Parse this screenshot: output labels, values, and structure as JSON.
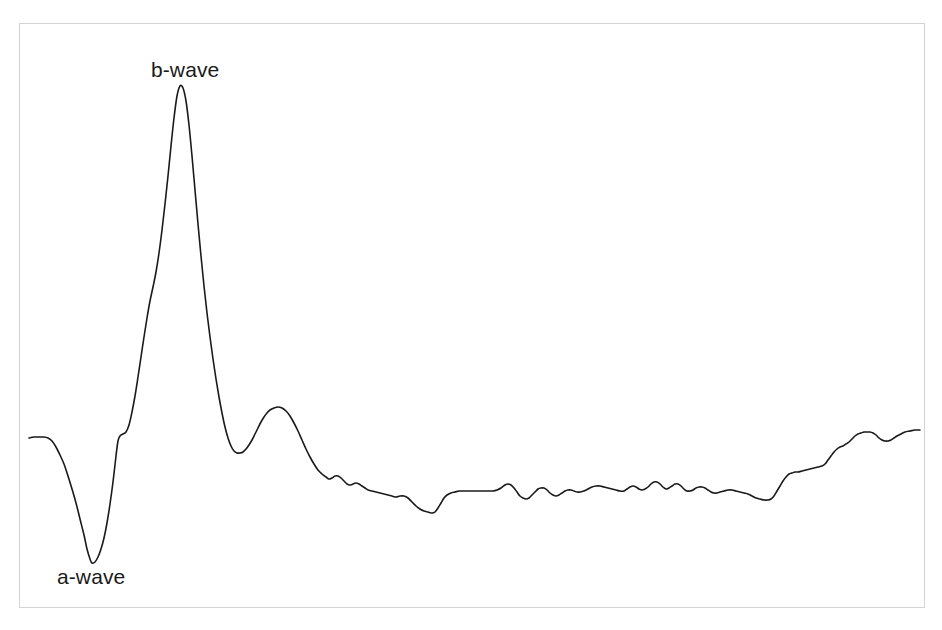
{
  "figure": {
    "kind": "electroretinogram-trace",
    "background_color": "#ffffff",
    "frame": {
      "border_color": "#d3d3d3",
      "fill_color": "#ffffff",
      "x": 19,
      "y": 23,
      "width": 906,
      "height": 585
    }
  },
  "annotations": {
    "b_wave_label": "b-wave",
    "a_wave_label": "a-wave"
  },
  "chart_data": {
    "type": "line",
    "title": "",
    "subtitle": "",
    "xlabel": "",
    "ylabel": "",
    "grid": false,
    "legend": null,
    "axes_visible": false,
    "tick_labels_x": [],
    "tick_labels_y": [],
    "xlim": [
      29,
      920
    ],
    "ylim": [
      608,
      23
    ],
    "series": [
      {
        "name": "ERG response",
        "color": "#1a1a1a",
        "line_width": 1.6,
        "points": [
          [
            29,
            438
          ],
          [
            34,
            437
          ],
          [
            39,
            437
          ],
          [
            44,
            437
          ],
          [
            48,
            438
          ],
          [
            52,
            441
          ],
          [
            56,
            447
          ],
          [
            60,
            455
          ],
          [
            64,
            464
          ],
          [
            68,
            476
          ],
          [
            72,
            489
          ],
          [
            76,
            503
          ],
          [
            80,
            519
          ],
          [
            84,
            535
          ],
          [
            87,
            549
          ],
          [
            90,
            559
          ],
          [
            92,
            563
          ],
          [
            95,
            562
          ],
          [
            98,
            557
          ],
          [
            101,
            549
          ],
          [
            104,
            538
          ],
          [
            107,
            523
          ],
          [
            110,
            504
          ],
          [
            113,
            482
          ],
          [
            116,
            456
          ],
          [
            118,
            441
          ],
          [
            120,
            436
          ],
          [
            123,
            434
          ],
          [
            126,
            432
          ],
          [
            129,
            425
          ],
          [
            132,
            412
          ],
          [
            135,
            396
          ],
          [
            138,
            377
          ],
          [
            141,
            357
          ],
          [
            144,
            337
          ],
          [
            147,
            318
          ],
          [
            150,
            301
          ],
          [
            153,
            287
          ],
          [
            156,
            272
          ],
          [
            159,
            253
          ],
          [
            162,
            230
          ],
          [
            165,
            204
          ],
          [
            168,
            176
          ],
          [
            171,
            146
          ],
          [
            174,
            118
          ],
          [
            177,
            96
          ],
          [
            180,
            86
          ],
          [
            183,
            88
          ],
          [
            186,
            101
          ],
          [
            189,
            125
          ],
          [
            192,
            156
          ],
          [
            195,
            190
          ],
          [
            198,
            224
          ],
          [
            201,
            256
          ],
          [
            204,
            286
          ],
          [
            207,
            313
          ],
          [
            210,
            337
          ],
          [
            213,
            359
          ],
          [
            216,
            379
          ],
          [
            219,
            397
          ],
          [
            222,
            413
          ],
          [
            225,
            427
          ],
          [
            228,
            438
          ],
          [
            231,
            446
          ],
          [
            234,
            451
          ],
          [
            237,
            453
          ],
          [
            240,
            453
          ],
          [
            243,
            452
          ],
          [
            246,
            449
          ],
          [
            249,
            445
          ],
          [
            252,
            440
          ],
          [
            255,
            434
          ],
          [
            258,
            428
          ],
          [
            261,
            422
          ],
          [
            264,
            417
          ],
          [
            267,
            413
          ],
          [
            270,
            410
          ],
          [
            274,
            408
          ],
          [
            278,
            407
          ],
          [
            282,
            408
          ],
          [
            286,
            411
          ],
          [
            290,
            416
          ],
          [
            294,
            423
          ],
          [
            298,
            431
          ],
          [
            302,
            440
          ],
          [
            306,
            449
          ],
          [
            310,
            457
          ],
          [
            314,
            464
          ],
          [
            318,
            470
          ],
          [
            322,
            474
          ],
          [
            326,
            477
          ],
          [
            329,
            479
          ],
          [
            332,
            478
          ],
          [
            335,
            476
          ],
          [
            338,
            476
          ],
          [
            341,
            478
          ],
          [
            344,
            481
          ],
          [
            347,
            484
          ],
          [
            350,
            485
          ],
          [
            353,
            484
          ],
          [
            356,
            483
          ],
          [
            359,
            484
          ],
          [
            362,
            486
          ],
          [
            365,
            488
          ],
          [
            368,
            490
          ],
          [
            372,
            491
          ],
          [
            376,
            492
          ],
          [
            380,
            493
          ],
          [
            384,
            494
          ],
          [
            388,
            495
          ],
          [
            392,
            496
          ],
          [
            396,
            497
          ],
          [
            400,
            496
          ],
          [
            404,
            496
          ],
          [
            408,
            498
          ],
          [
            412,
            502
          ],
          [
            416,
            506
          ],
          [
            420,
            509
          ],
          [
            424,
            511
          ],
          [
            428,
            512
          ],
          [
            432,
            513
          ],
          [
            435,
            512
          ],
          [
            438,
            508
          ],
          [
            441,
            503
          ],
          [
            444,
            498
          ],
          [
            447,
            495
          ],
          [
            451,
            493
          ],
          [
            455,
            492
          ],
          [
            459,
            491
          ],
          [
            463,
            491
          ],
          [
            468,
            491
          ],
          [
            473,
            491
          ],
          [
            478,
            491
          ],
          [
            483,
            491
          ],
          [
            488,
            491
          ],
          [
            493,
            491
          ],
          [
            497,
            490
          ],
          [
            501,
            488
          ],
          [
            505,
            485
          ],
          [
            508,
            484
          ],
          [
            511,
            485
          ],
          [
            514,
            488
          ],
          [
            517,
            492
          ],
          [
            520,
            496
          ],
          [
            523,
            498
          ],
          [
            526,
            499
          ],
          [
            529,
            498
          ],
          [
            532,
            495
          ],
          [
            535,
            492
          ],
          [
            538,
            489
          ],
          [
            541,
            488
          ],
          [
            544,
            488
          ],
          [
            547,
            490
          ],
          [
            550,
            493
          ],
          [
            553,
            495
          ],
          [
            556,
            496
          ],
          [
            559,
            495
          ],
          [
            562,
            493
          ],
          [
            565,
            491
          ],
          [
            568,
            490
          ],
          [
            571,
            490
          ],
          [
            574,
            491
          ],
          [
            577,
            492
          ],
          [
            580,
            492
          ],
          [
            584,
            491
          ],
          [
            588,
            489
          ],
          [
            592,
            487
          ],
          [
            596,
            486
          ],
          [
            600,
            486
          ],
          [
            604,
            487
          ],
          [
            608,
            488
          ],
          [
            612,
            489
          ],
          [
            616,
            490
          ],
          [
            620,
            491
          ],
          [
            624,
            491
          ],
          [
            627,
            489
          ],
          [
            630,
            487
          ],
          [
            633,
            486
          ],
          [
            636,
            487
          ],
          [
            639,
            489
          ],
          [
            642,
            490
          ],
          [
            645,
            489
          ],
          [
            648,
            487
          ],
          [
            651,
            484
          ],
          [
            654,
            482
          ],
          [
            657,
            482
          ],
          [
            660,
            484
          ],
          [
            663,
            487
          ],
          [
            666,
            489
          ],
          [
            669,
            488
          ],
          [
            672,
            486
          ],
          [
            675,
            484
          ],
          [
            678,
            484
          ],
          [
            681,
            486
          ],
          [
            684,
            489
          ],
          [
            687,
            491
          ],
          [
            690,
            491
          ],
          [
            693,
            490
          ],
          [
            696,
            488
          ],
          [
            699,
            487
          ],
          [
            702,
            487
          ],
          [
            705,
            488
          ],
          [
            708,
            490
          ],
          [
            711,
            492
          ],
          [
            714,
            493
          ],
          [
            717,
            493
          ],
          [
            720,
            492
          ],
          [
            724,
            491
          ],
          [
            728,
            490
          ],
          [
            732,
            490
          ],
          [
            736,
            491
          ],
          [
            740,
            492
          ],
          [
            744,
            493
          ],
          [
            748,
            494
          ],
          [
            752,
            496
          ],
          [
            756,
            498
          ],
          [
            760,
            499
          ],
          [
            764,
            500
          ],
          [
            768,
            500
          ],
          [
            771,
            499
          ],
          [
            774,
            496
          ],
          [
            777,
            491
          ],
          [
            780,
            486
          ],
          [
            783,
            481
          ],
          [
            786,
            477
          ],
          [
            789,
            474
          ],
          [
            792,
            473
          ],
          [
            795,
            472
          ],
          [
            798,
            472
          ],
          [
            802,
            471
          ],
          [
            806,
            470
          ],
          [
            810,
            469
          ],
          [
            814,
            468
          ],
          [
            818,
            467
          ],
          [
            822,
            466
          ],
          [
            825,
            464
          ],
          [
            828,
            460
          ],
          [
            831,
            456
          ],
          [
            834,
            452
          ],
          [
            837,
            449
          ],
          [
            840,
            447
          ],
          [
            843,
            446
          ],
          [
            846,
            444
          ],
          [
            849,
            442
          ],
          [
            852,
            439
          ],
          [
            855,
            436
          ],
          [
            858,
            434
          ],
          [
            861,
            433
          ],
          [
            864,
            432
          ],
          [
            867,
            432
          ],
          [
            870,
            432
          ],
          [
            873,
            433
          ],
          [
            876,
            435
          ],
          [
            879,
            438
          ],
          [
            882,
            440
          ],
          [
            885,
            441
          ],
          [
            888,
            441
          ],
          [
            891,
            440
          ],
          [
            894,
            438
          ],
          [
            897,
            436
          ],
          [
            901,
            434
          ],
          [
            905,
            432
          ],
          [
            910,
            431
          ],
          [
            915,
            430
          ],
          [
            920,
            430
          ]
        ]
      }
    ],
    "annotations": [
      {
        "text": "b-wave",
        "target_x": 180,
        "target_y": 86,
        "label_x": 151,
        "label_y": 58,
        "description": "peak of the positive b-wave deflection"
      },
      {
        "text": "a-wave",
        "target_x": 92,
        "target_y": 563,
        "label_x": 57,
        "label_y": 565,
        "description": "trough of the negative a-wave deflection"
      }
    ]
  }
}
